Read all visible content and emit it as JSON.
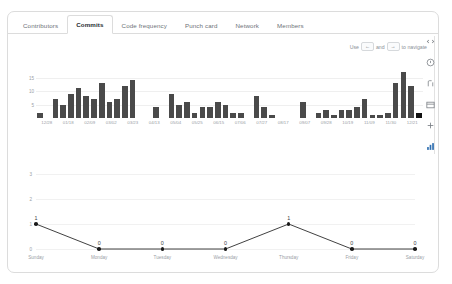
{
  "tabs": [
    {
      "label": "Contributors",
      "active": false
    },
    {
      "label": "Commits",
      "active": true
    },
    {
      "label": "Code frequency",
      "active": false
    },
    {
      "label": "Punch card",
      "active": false
    },
    {
      "label": "Network",
      "active": false
    },
    {
      "label": "Members",
      "active": false
    }
  ],
  "nav_hint": {
    "prefix": "Use",
    "key_left": "←",
    "middle": "and",
    "key_right": "→",
    "suffix": "to navigate"
  },
  "rail": [
    {
      "icon": "code-icon",
      "label": "Code",
      "active": false
    },
    {
      "icon": "issue-opened-icon",
      "label": "Issues",
      "active": false
    },
    {
      "icon": "git-pull-request-icon",
      "label": "Pull requests",
      "active": false
    },
    {
      "icon": "project-board-icon",
      "label": "Projects",
      "active": false
    },
    {
      "icon": "plus-icon",
      "label": "Insights",
      "active": false
    },
    {
      "icon": "graph-bar-icon",
      "label": "Graphs",
      "active": true
    }
  ],
  "chart_data": [
    {
      "type": "bar",
      "title": "",
      "xlabel": "",
      "ylabel": "",
      "ylim": [
        0,
        20
      ],
      "yticks": [
        15,
        10,
        5
      ],
      "grid": true,
      "categories": [
        "12/28",
        "01/04",
        "01/11",
        "01/18",
        "01/25",
        "02/01",
        "02/09",
        "02/15",
        "02/22",
        "03/01",
        "03/08",
        "03/15",
        "03/23",
        "03/29",
        "04/05",
        "04/13",
        "04/19",
        "04/26",
        "05/04",
        "05/10",
        "05/17",
        "05/24",
        "05/31",
        "06/07",
        "06/15",
        "06/21",
        "06/28",
        "07/05",
        "07/12",
        "07/20",
        "07/27",
        "08/03",
        "08/10",
        "08/17",
        "08/24",
        "08/31",
        "09/07",
        "09/14",
        "09/21",
        "09/28",
        "10/05",
        "10/12",
        "10/19",
        "10/26",
        "11/03",
        "11/09",
        "11/16",
        "11/23",
        "11/30",
        "12/07",
        "12/14",
        "12/21"
      ],
      "xtick_labels": [
        "12/28",
        "01/18",
        "02/09",
        "03/02",
        "03/23",
        "04/13",
        "05/04",
        "05/25",
        "06/15",
        "07/06",
        "07/27",
        "08/17",
        "09/07",
        "09/28",
        "10/19",
        "11/09",
        "11/30",
        "12/21"
      ],
      "values": [
        2,
        0,
        7,
        5,
        9,
        11,
        8,
        7,
        13,
        6,
        7,
        12,
        14,
        0,
        0,
        4,
        0,
        9,
        5,
        6,
        2,
        4,
        4,
        6,
        5,
        2,
        2,
        0,
        8,
        4,
        1,
        0,
        0,
        0,
        6,
        0,
        2,
        3,
        1,
        3,
        3,
        4,
        7,
        1,
        1,
        2,
        13,
        17,
        12,
        2
      ],
      "selected_index": 49,
      "selected_label": "12/21"
    },
    {
      "type": "line",
      "title": "",
      "xlabel": "",
      "ylabel": "",
      "ylim": [
        0,
        4
      ],
      "yticks": [
        3,
        2,
        1,
        0
      ],
      "grid": true,
      "categories": [
        "Sunday",
        "Monday",
        "Tuesday",
        "Wednesday",
        "Thursday",
        "Friday",
        "Saturday"
      ],
      "values": [
        1,
        0,
        0,
        0,
        1,
        0,
        0
      ],
      "point_labels": [
        "1",
        "0",
        "0",
        "0",
        "1",
        "0",
        "0"
      ],
      "line_color": "#2b2b2b",
      "marker_color": "#1b1b1b"
    }
  ]
}
